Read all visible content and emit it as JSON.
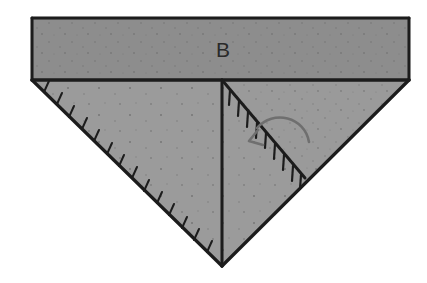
{
  "figure": {
    "type": "origami-fold-diagram",
    "background_color": "#ffffff",
    "canvas": {
      "width": 427,
      "height": 283
    },
    "labels": [
      {
        "id": "label-b",
        "text": "B",
        "x": 216,
        "y": 57,
        "description": "handwritten letter label on upper band"
      }
    ],
    "colors": {
      "paper_white": "#ffffff",
      "band_gray": "#8d8d8d",
      "triangle_gray": "#9b9b9b",
      "flap_gray": "#9a9a9a",
      "ink_black": "#1c1c1c",
      "arrow_gray": "#6f6f6f",
      "speckle_gray": "#5a5a5a"
    },
    "shapes": [
      {
        "id": "upper-band",
        "name": "upper-band-rectangle",
        "kind": "polygon",
        "points": "32,18 409,18 409,80 32,80",
        "fill": "#8d8d8d"
      },
      {
        "id": "lower-triangle",
        "name": "lower-triangle-body",
        "kind": "polygon",
        "points": "32,80 409,80 222,266",
        "fill": "#9b9b9b"
      },
      {
        "id": "right-flap",
        "name": "right-folded-flap",
        "kind": "polygon",
        "points": "222,80 409,80 305,178",
        "fill": "#999999"
      }
    ],
    "edges": [
      {
        "id": "edge-top",
        "name": "band-top-edge",
        "d": "M 32 18 L 409 18"
      },
      {
        "id": "edge-band-left",
        "name": "band-left-edge",
        "d": "M 32 18 L 32 80"
      },
      {
        "id": "edge-band-right",
        "name": "band-right-edge",
        "d": "M 409 18 L 409 80"
      },
      {
        "id": "edge-band-bottom",
        "name": "band-bottom-fold-line",
        "d": "M 32 80 L 409 80"
      },
      {
        "id": "edge-left-diagonal",
        "name": "left-diagonal-edge",
        "d": "M 32 80 L 222 266"
      },
      {
        "id": "edge-right-diagonal",
        "name": "right-diagonal-edge",
        "d": "M 409 80 L 222 266"
      },
      {
        "id": "edge-center-vertical",
        "name": "center-vertical-crease",
        "d": "M 222 80 L 222 266"
      },
      {
        "id": "edge-flap-diagonal",
        "name": "flap-diagonal-crease",
        "d": "M 222 80 L 305 178"
      }
    ],
    "hatching": [
      {
        "id": "hatch-left",
        "name": "left-edge-hatch-marks",
        "from": {
          "x": 32,
          "y": 80
        },
        "to": {
          "x": 222,
          "y": 266
        },
        "count": 15,
        "length": 11,
        "side": "inward-up-right"
      },
      {
        "id": "hatch-flap",
        "name": "flap-diagonal-hatch-marks",
        "from": {
          "x": 222,
          "y": 80
        },
        "to": {
          "x": 305,
          "y": 178
        },
        "count": 9,
        "length": 15,
        "side": "below-left"
      }
    ],
    "arrow": {
      "id": "fold-arrow",
      "name": "fold-direction-arrow",
      "description": "curved arrow indicating the right flap folds down-left across the crease",
      "color": "#6f6f6f",
      "path": "M 307 139 C 302 118 272 112 258 130",
      "head": "M 250 140 L 259 133 M 250 140 L 262 146",
      "direction": "down-left"
    }
  }
}
